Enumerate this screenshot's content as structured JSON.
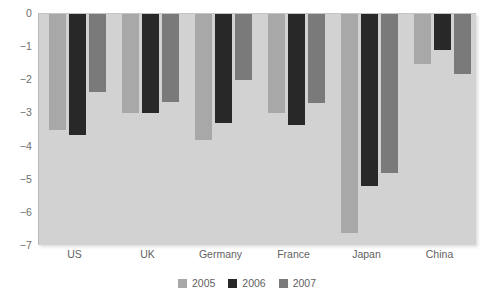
{
  "chart_data": {
    "type": "bar",
    "title": "",
    "subtitle": "",
    "xlabel": "",
    "ylabel": "",
    "categories": [
      "US",
      "UK",
      "Germany",
      "France",
      "Japan",
      "China"
    ],
    "series": [
      {
        "name": "2005",
        "color": "#a8a8a8",
        "values": [
          -3.5,
          -3.0,
          -3.8,
          -3.0,
          -6.6,
          -1.5
        ]
      },
      {
        "name": "2006",
        "color": "#282828",
        "values": [
          -3.65,
          -3.0,
          -3.3,
          -3.35,
          -5.2,
          -1.1
        ]
      },
      {
        "name": "2007",
        "color": "#7a7a7a",
        "values": [
          -2.35,
          -2.65,
          -2.0,
          -2.7,
          -4.8,
          -1.8
        ]
      }
    ],
    "ylim": [
      -7,
      0
    ],
    "y_ticks": [
      0,
      -1,
      -2,
      -3,
      -4,
      -5,
      -6,
      -7
    ],
    "y_tick_labels": [
      "0",
      "−1",
      "−2",
      "−3",
      "−4",
      "−5",
      "−6",
      "−7"
    ],
    "grid": false,
    "legend_position": "bottom",
    "plot_background": "#d2d2d2",
    "figure_background": "#ffffff"
  }
}
